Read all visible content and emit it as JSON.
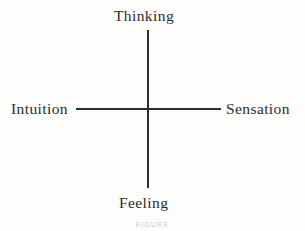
{
  "figure": {
    "type": "cross-diagram",
    "background_color": "#fdfdfb",
    "line_color": "#2e2e2e",
    "text_color": "#2b2b2b",
    "caption": "FIGURE",
    "axes": {
      "vertical": {
        "top_label": "Thinking",
        "bottom_label": "Feeling"
      },
      "horizontal": {
        "left_label": "Intuition",
        "right_label": "Sensation"
      }
    },
    "labels": {
      "thinking": "Thinking",
      "feeling": "Feeling",
      "intuition": "Intuition",
      "sensation": "Sensation"
    }
  }
}
